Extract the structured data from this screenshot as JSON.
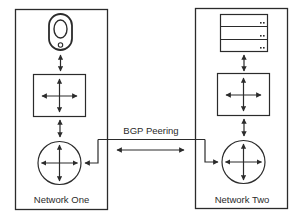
{
  "diagram": {
    "type": "network-topology",
    "connection": {
      "label": "BGP Peering",
      "direction": "bidirectional"
    },
    "networks": [
      {
        "name": "Network One",
        "nodes": [
          {
            "kind": "endpoint-device",
            "icon": "device-icon"
          },
          {
            "kind": "switch",
            "icon": "switch-icon"
          },
          {
            "kind": "router",
            "icon": "router-icon"
          }
        ]
      },
      {
        "name": "Network Two",
        "nodes": [
          {
            "kind": "server-stack",
            "icon": "server-icon",
            "units": 3
          },
          {
            "kind": "switch",
            "icon": "switch-icon"
          },
          {
            "kind": "router",
            "icon": "router-icon"
          }
        ]
      }
    ],
    "colors": {
      "stroke": "#2b2b2b",
      "background": "#ffffff"
    }
  }
}
